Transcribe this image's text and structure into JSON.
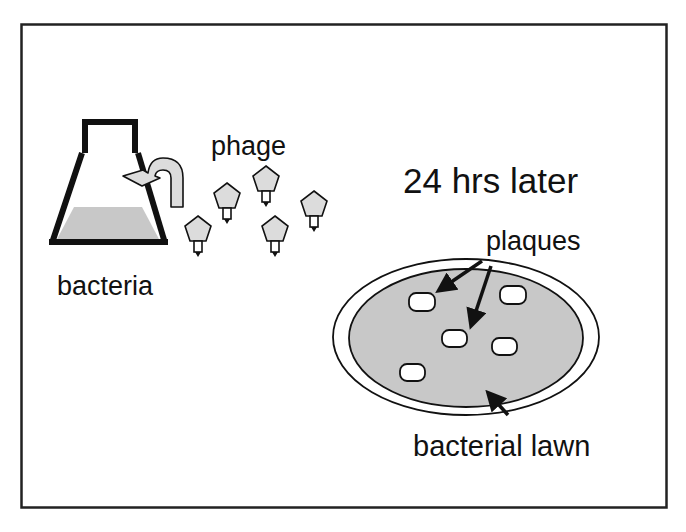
{
  "labels": {
    "bacteria": "bacteria",
    "phage": "phage",
    "time": "24 hrs later",
    "plaques": "plaques",
    "lawn": "bacterial lawn"
  },
  "colors": {
    "stroke": "#111111",
    "fill_gray": "#c8c8c8",
    "phage_fill": "#dcdcdc",
    "plaque_fill": "#ffffff",
    "background": "#ffffff"
  },
  "diagram": {
    "phage_count": 6,
    "plaque_count": 5
  }
}
